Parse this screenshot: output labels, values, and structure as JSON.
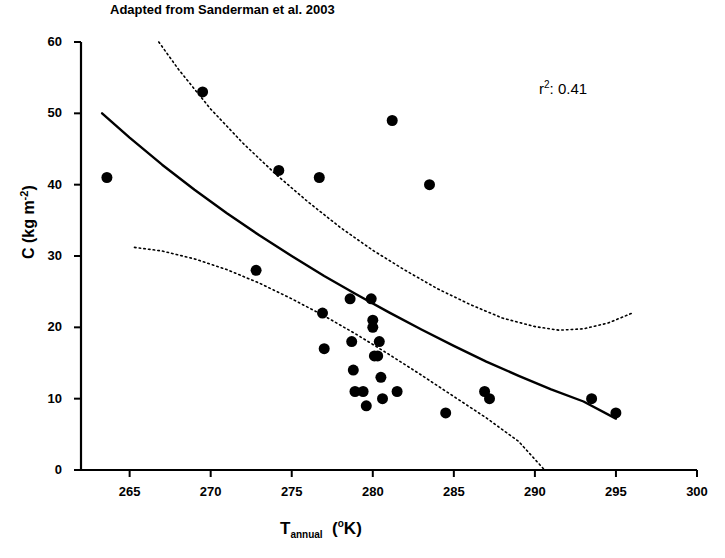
{
  "chart_data": {
    "type": "scatter",
    "title": "Adapted from Sanderman et al. 2003",
    "xlabel": "T_annual (°K)",
    "xlabel_base": "T",
    "xlabel_sub": "annual",
    "xlabel_unit": "(°K)",
    "ylabel": "C (kg m-2)",
    "ylabel_base": "C (kg m",
    "ylabel_exp": "-2",
    "ylabel_close": ")",
    "xlim": [
      262,
      300
    ],
    "ylim": [
      0,
      60
    ],
    "xticks": [
      265,
      270,
      275,
      280,
      285,
      290,
      295,
      300
    ],
    "yticks": [
      0,
      10,
      20,
      30,
      40,
      50,
      60
    ],
    "grid": false,
    "legend": null,
    "annotations": [
      {
        "name": "r-squared",
        "text_prefix": "r",
        "text_sup": "2",
        "text_suffix": ": 0.41",
        "x": 293.5,
        "y": 52
      }
    ],
    "marker": {
      "shape": "circle",
      "color": "#000000",
      "size_px": 11
    },
    "points": [
      {
        "x": 263.6,
        "y": 41
      },
      {
        "x": 269.5,
        "y": 53
      },
      {
        "x": 272.8,
        "y": 28
      },
      {
        "x": 274.2,
        "y": 42
      },
      {
        "x": 276.7,
        "y": 41
      },
      {
        "x": 276.9,
        "y": 22
      },
      {
        "x": 277.0,
        "y": 17
      },
      {
        "x": 278.6,
        "y": 24
      },
      {
        "x": 278.7,
        "y": 18
      },
      {
        "x": 278.8,
        "y": 14
      },
      {
        "x": 278.9,
        "y": 11
      },
      {
        "x": 279.4,
        "y": 11
      },
      {
        "x": 279.6,
        "y": 9
      },
      {
        "x": 279.9,
        "y": 24
      },
      {
        "x": 280.0,
        "y": 21
      },
      {
        "x": 280.0,
        "y": 20
      },
      {
        "x": 280.1,
        "y": 16
      },
      {
        "x": 280.3,
        "y": 16
      },
      {
        "x": 280.4,
        "y": 18
      },
      {
        "x": 280.5,
        "y": 13
      },
      {
        "x": 280.6,
        "y": 10
      },
      {
        "x": 281.2,
        "y": 49
      },
      {
        "x": 281.5,
        "y": 11
      },
      {
        "x": 283.5,
        "y": 40
      },
      {
        "x": 284.5,
        "y": 8
      },
      {
        "x": 286.9,
        "y": 11
      },
      {
        "x": 287.2,
        "y": 10
      },
      {
        "x": 293.5,
        "y": 10
      },
      {
        "x": 295.0,
        "y": 8
      }
    ],
    "fit_curve": {
      "name": "regression-fit",
      "style": "solid",
      "color": "#000000",
      "width_px": 2.4,
      "points": [
        {
          "x": 263.3,
          "y": 50.0
        },
        {
          "x": 265.0,
          "y": 46.6
        },
        {
          "x": 267.0,
          "y": 42.8
        },
        {
          "x": 269.0,
          "y": 39.3
        },
        {
          "x": 271.0,
          "y": 36.0
        },
        {
          "x": 273.0,
          "y": 32.9
        },
        {
          "x": 275.0,
          "y": 30.0
        },
        {
          "x": 277.0,
          "y": 27.2
        },
        {
          "x": 279.0,
          "y": 24.6
        },
        {
          "x": 281.0,
          "y": 22.1
        },
        {
          "x": 283.0,
          "y": 19.7
        },
        {
          "x": 285.0,
          "y": 17.4
        },
        {
          "x": 287.0,
          "y": 15.2
        },
        {
          "x": 289.0,
          "y": 13.2
        },
        {
          "x": 291.0,
          "y": 11.3
        },
        {
          "x": 293.0,
          "y": 9.6
        },
        {
          "x": 295.0,
          "y": 7.2
        }
      ]
    },
    "confidence_bands": [
      {
        "name": "upper-confidence-band",
        "style": "dotted",
        "color": "#000000",
        "width_px": 1.6,
        "points": [
          {
            "x": 266.8,
            "y": 60.0
          },
          {
            "x": 268.0,
            "y": 56.2
          },
          {
            "x": 270.0,
            "y": 50.6
          },
          {
            "x": 272.0,
            "y": 45.8
          },
          {
            "x": 274.0,
            "y": 41.5
          },
          {
            "x": 276.0,
            "y": 37.6
          },
          {
            "x": 278.0,
            "y": 34.0
          },
          {
            "x": 280.0,
            "y": 30.8
          },
          {
            "x": 282.0,
            "y": 28.0
          },
          {
            "x": 284.0,
            "y": 25.4
          },
          {
            "x": 286.0,
            "y": 23.2
          },
          {
            "x": 288.0,
            "y": 21.3
          },
          {
            "x": 290.0,
            "y": 20.1
          },
          {
            "x": 291.5,
            "y": 19.6
          },
          {
            "x": 293.0,
            "y": 19.8
          },
          {
            "x": 294.5,
            "y": 20.6
          },
          {
            "x": 296.0,
            "y": 22.0
          }
        ]
      },
      {
        "name": "lower-confidence-band",
        "style": "dotted",
        "color": "#000000",
        "width_px": 1.6,
        "points": [
          {
            "x": 265.3,
            "y": 31.2
          },
          {
            "x": 267.0,
            "y": 30.7
          },
          {
            "x": 269.0,
            "y": 29.6
          },
          {
            "x": 271.0,
            "y": 28.1
          },
          {
            "x": 273.0,
            "y": 26.2
          },
          {
            "x": 275.0,
            "y": 24.0
          },
          {
            "x": 277.0,
            "y": 21.6
          },
          {
            "x": 279.0,
            "y": 19.0
          },
          {
            "x": 281.0,
            "y": 16.2
          },
          {
            "x": 283.0,
            "y": 13.3
          },
          {
            "x": 285.0,
            "y": 10.3
          },
          {
            "x": 287.0,
            "y": 7.3
          },
          {
            "x": 289.0,
            "y": 4.0
          },
          {
            "x": 290.6,
            "y": 0.0
          }
        ]
      }
    ]
  }
}
